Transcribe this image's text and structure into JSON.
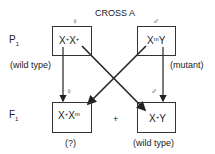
{
  "title": "CROSS A",
  "symbols": {
    "female": "♀",
    "male": "♂"
  },
  "generations": {
    "p1": "P",
    "p1_sub": "1",
    "f1": "F",
    "f1_sub": "1"
  },
  "p1": {
    "female": {
      "genotype_base1": "X",
      "sup1": "+",
      "genotype_base2": "X",
      "sup2": "+",
      "label": "(wild type)"
    },
    "male": {
      "genotype_base1": "X",
      "sup1": "m",
      "genotype_base2": "Y",
      "label": "(mutant)"
    }
  },
  "f1": {
    "female": {
      "genotype_base1": "X",
      "sup1": "+",
      "genotype_base2": "X",
      "sup2": "m",
      "label": "(?)"
    },
    "plus": "+",
    "male": {
      "genotype_base1": "X",
      "sup1": "+",
      "genotype_base2": "Y",
      "label": "(wild type)"
    }
  }
}
